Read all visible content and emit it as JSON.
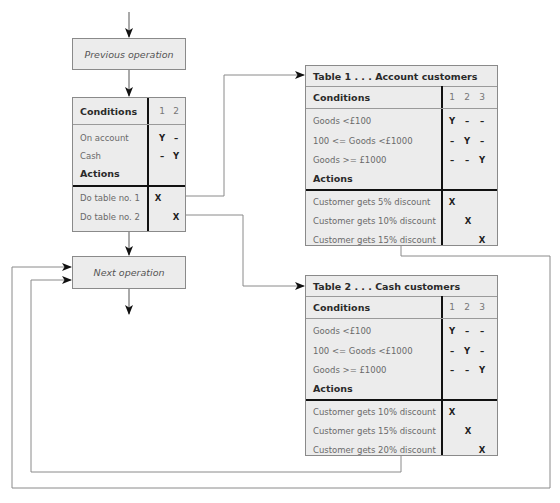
{
  "flow": {
    "previous_operation": "Previous operation",
    "next_operation": "Next operation"
  },
  "main_table": {
    "conditions_header": "Conditions",
    "rule_numbers": [
      "1",
      "2"
    ],
    "conditions": [
      {
        "label": "On account",
        "values": [
          "Y",
          "–"
        ]
      },
      {
        "label": "Cash",
        "values": [
          "–",
          "Y"
        ]
      }
    ],
    "actions_header": "Actions",
    "actions": [
      {
        "label": "Do table no. 1",
        "values": [
          "X",
          ""
        ]
      },
      {
        "label": "Do table no. 2",
        "values": [
          "",
          "X"
        ]
      }
    ]
  },
  "table1": {
    "title": "Table 1 . . . Account customers",
    "conditions_header": "Conditions",
    "rule_numbers": [
      "1",
      "2",
      "3"
    ],
    "conditions": [
      {
        "label": "Goods <£100",
        "values": [
          "Y",
          "–",
          "–"
        ]
      },
      {
        "label": "100 <= Goods <£1000",
        "values": [
          "–",
          "Y",
          "–"
        ]
      },
      {
        "label": "Goods >= £1000",
        "values": [
          "–",
          "–",
          "Y"
        ]
      }
    ],
    "actions_header": "Actions",
    "actions": [
      {
        "label": "Customer gets 5% discount",
        "values": [
          "X",
          "",
          ""
        ]
      },
      {
        "label": "Customer gets 10% discount",
        "values": [
          "",
          "X",
          ""
        ]
      },
      {
        "label": "Customer gets 15% discount",
        "values": [
          "",
          "",
          "X"
        ]
      }
    ]
  },
  "table2": {
    "title": "Table 2 . . . Cash customers",
    "conditions_header": "Conditions",
    "rule_numbers": [
      "1",
      "2",
      "3"
    ],
    "conditions": [
      {
        "label": "Goods <£100",
        "values": [
          "Y",
          "–",
          "–"
        ]
      },
      {
        "label": "100 <= Goods <£1000",
        "values": [
          "–",
          "Y",
          "–"
        ]
      },
      {
        "label": "Goods >= £1000",
        "values": [
          "–",
          "–",
          "Y"
        ]
      }
    ],
    "actions_header": "Actions",
    "actions": [
      {
        "label": "Customer gets 10% discount",
        "values": [
          "X",
          "",
          ""
        ]
      },
      {
        "label": "Customer gets 15% discount",
        "values": [
          "",
          "X",
          ""
        ]
      },
      {
        "label": "Customer gets 20% discount",
        "values": [
          "",
          "",
          "X"
        ]
      }
    ]
  },
  "colors": {
    "box_fill": "#ececec",
    "box_border": "#8a8a8a",
    "divider": "#111111",
    "wire": "#8a8a8a",
    "arrow": "#111111"
  }
}
